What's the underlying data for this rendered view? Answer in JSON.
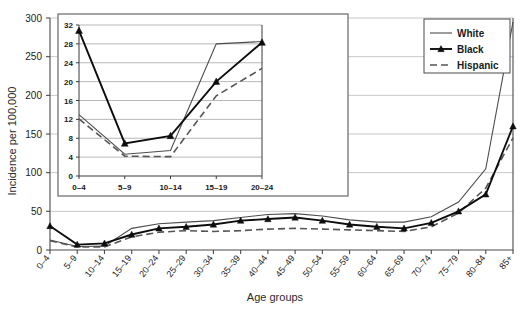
{
  "chart_data": [
    {
      "id": "main",
      "type": "line",
      "title": "",
      "xlabel": "Age groups",
      "ylabel": "Incidence per 100,000",
      "ylim": [
        0,
        300
      ],
      "yticks": [
        0,
        50,
        100,
        150,
        200,
        250,
        300
      ],
      "grid": true,
      "legend_position": "top-right",
      "categories": [
        "0–4",
        "5–9",
        "10–14",
        "15–19",
        "20–24",
        "25–29",
        "30–34",
        "35–39",
        "40–44",
        "45–49",
        "50–54",
        "55–59",
        "60–64",
        "65–69",
        "70–74",
        "75–79",
        "80–84",
        "85+"
      ],
      "series": [
        {
          "name": "White",
          "style": "solid",
          "marker": "none",
          "color": "#4d4d4d",
          "values": [
            13,
            4.5,
            5,
            28,
            34,
            36,
            38,
            42,
            46,
            47,
            44,
            39,
            36,
            36,
            43,
            62,
            105,
            295
          ]
        },
        {
          "name": "Black",
          "style": "solid",
          "marker": "triangle",
          "color": "#0d0d0d",
          "values": [
            31,
            7,
            8.5,
            20,
            28,
            30,
            33,
            38,
            40,
            42,
            38,
            33,
            30,
            28,
            35,
            50,
            72,
            160
          ]
        },
        {
          "name": "Hispanic",
          "style": "dashed",
          "marker": "none",
          "color": "#555555",
          "values": [
            12,
            4,
            4,
            17,
            23,
            25,
            24,
            25,
            27,
            28,
            27,
            26,
            25,
            24,
            30,
            48,
            80,
            145
          ]
        }
      ]
    },
    {
      "id": "inset",
      "type": "line",
      "title": "",
      "xlabel": "",
      "ylabel": "",
      "ylim": [
        0,
        32
      ],
      "yticks": [
        0,
        4,
        8,
        12,
        16,
        20,
        24,
        28,
        32
      ],
      "grid": true,
      "categories": [
        "0–4",
        "5–9",
        "10–14",
        "15–19",
        "20–24"
      ],
      "series": [
        {
          "name": "White",
          "style": "solid",
          "marker": "none",
          "color": "#4d4d4d",
          "values": [
            13,
            4.6,
            5.4,
            28,
            28.5
          ]
        },
        {
          "name": "Black",
          "style": "solid",
          "marker": "triangle",
          "color": "#0d0d0d",
          "values": [
            30.8,
            6.9,
            8.5,
            20,
            28.3
          ]
        },
        {
          "name": "Hispanic",
          "style": "dashed",
          "marker": "none",
          "color": "#555555",
          "values": [
            12.1,
            4.2,
            4.1,
            17,
            22.8
          ]
        }
      ]
    }
  ],
  "legend": {
    "items": [
      {
        "label": "White",
        "style": "solid",
        "marker": "none"
      },
      {
        "label": "Black",
        "style": "solid",
        "marker": "triangle"
      },
      {
        "label": "Hispanic",
        "style": "dashed",
        "marker": "none"
      }
    ]
  },
  "axes": {
    "main_ylabel": "Incidence per 100,000",
    "main_xlabel": "Age groups"
  },
  "colors": {
    "white_series": "#4d4d4d",
    "black_series": "#0d0d0d",
    "hispanic_series": "#555555",
    "gridline": "#b9b9b9",
    "axis": "#4a4a4a",
    "background": "#ffffff"
  }
}
